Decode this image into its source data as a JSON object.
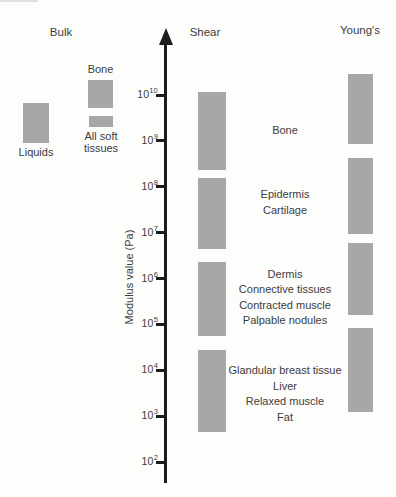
{
  "figure": {
    "background": "#fdfdfc",
    "bar_color": "#a7a7a7",
    "text_color": "#3c3c3c",
    "axis_color": "#1c1c1c"
  },
  "headers": [
    {
      "id": "bulk",
      "label": "Bulk",
      "x": 61,
      "y": 32
    },
    {
      "id": "shear",
      "label": "Shear",
      "x": 205,
      "y": 32
    },
    {
      "id": "youngs",
      "label": "Young's",
      "x": 360,
      "y": 30
    }
  ],
  "chart_data": {
    "type": "bar",
    "subtype": "vertical-log-range-bars",
    "ylabel": "Modulus value (Pa)",
    "yscale": "log10",
    "ylim_exponents": [
      2,
      10
    ],
    "grid": false,
    "tick_exponents": [
      10,
      9,
      8,
      7,
      6,
      5,
      4,
      3,
      2
    ],
    "tick_labels": [
      "10^10",
      "10^9",
      "10^8",
      "10^7",
      "10^6",
      "10^5",
      "10^4",
      "10^3",
      "10^2"
    ],
    "layout": {
      "exp_max": 10,
      "y_exp_max_px": 95,
      "px_per_decade": 45.875,
      "axis_x": 165.5,
      "axis_arrow_tip_y": 28,
      "axis_bottom_y": 483,
      "annotation_x": 285
    },
    "columns": [
      {
        "id": "bulk",
        "name": "Bulk",
        "bars": [
          {
            "label": "Bone",
            "label_lines": [
              "Bone"
            ],
            "label_position": "above",
            "log10_range": [
              9.72,
              10.33
            ],
            "x_center": 100.5,
            "bar_width": 25
          },
          {
            "label": "All soft tissues",
            "label_lines": [
              "All soft",
              "tissues"
            ],
            "label_position": "below",
            "log10_range": [
              9.3,
              9.54
            ],
            "x_center": 101,
            "bar_width": 24
          },
          {
            "label": "Liquids",
            "label_lines": [
              "Liquids"
            ],
            "label_position": "below",
            "log10_range": [
              8.95,
              9.83
            ],
            "x_center": 36,
            "bar_width": 26
          }
        ]
      },
      {
        "id": "shear",
        "name": "Shear",
        "x_center": 211.5,
        "bar_width": 28,
        "bars": [
          {
            "tissues": [
              "Bone"
            ],
            "log10_range": [
              8.37,
              10.07
            ],
            "label_dy": 0
          },
          {
            "tissues": [
              "Epidermis",
              "Cartilage"
            ],
            "log10_range": [
              6.64,
              8.19
            ],
            "label_dy": -11
          },
          {
            "tissues": [
              "Dermis",
              "Connective tissues",
              "Contracted muscle",
              "Palpable nodules"
            ],
            "log10_range": [
              4.75,
              6.36
            ],
            "label_dy": -1
          },
          {
            "tissues": [
              "Glandular breast tissue",
              "Liver",
              "Relaxed muscle",
              "Fat"
            ],
            "log10_range": [
              2.65,
              4.44
            ],
            "label_dy": 3
          }
        ]
      },
      {
        "id": "youngs",
        "name": "Young's",
        "x_center": 360.5,
        "bar_width": 25,
        "bars": [
          {
            "log10_range": [
              8.93,
              10.46
            ]
          },
          {
            "log10_range": [
              6.97,
              8.63
            ]
          },
          {
            "log10_range": [
              5.2,
              6.78
            ]
          },
          {
            "log10_range": [
              3.09,
              4.92
            ]
          }
        ]
      }
    ]
  }
}
